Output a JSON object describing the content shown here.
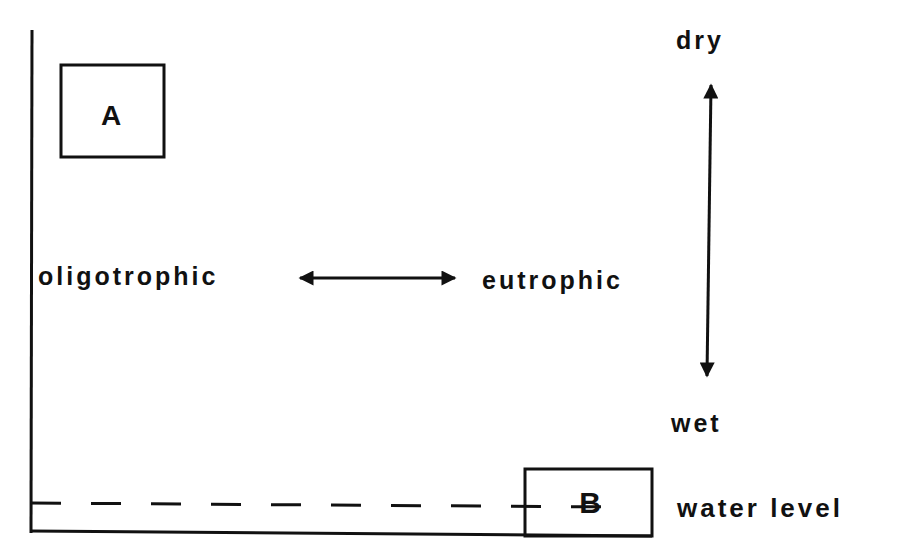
{
  "diagram": {
    "box_a_label": "A",
    "box_b_label": "B",
    "horizontal_axis": {
      "left_label": "oligotrophic",
      "right_label": "eutrophic"
    },
    "vertical_axis": {
      "top_label": "dry",
      "bottom_label": "wet"
    },
    "water_level_label": "water level",
    "ink_color": "#111111",
    "background_color": "#ffffff"
  }
}
